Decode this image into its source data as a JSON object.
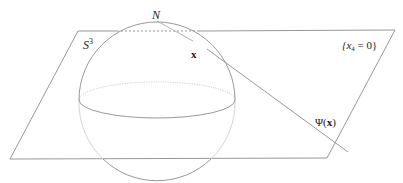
{
  "figure": {
    "labels": {
      "north_pole": "N",
      "sphere_base": "S",
      "sphere_exp": "3",
      "point": "x",
      "plane": "{x",
      "plane_sub": "4",
      "plane_rest": " = 0}",
      "image_prefix": "Ψ(",
      "image_arg": "x",
      "image_suffix": ")"
    },
    "colors": {
      "line": "#8c8c8c",
      "hidden": "#b8b8b8",
      "text": "#222222"
    }
  }
}
